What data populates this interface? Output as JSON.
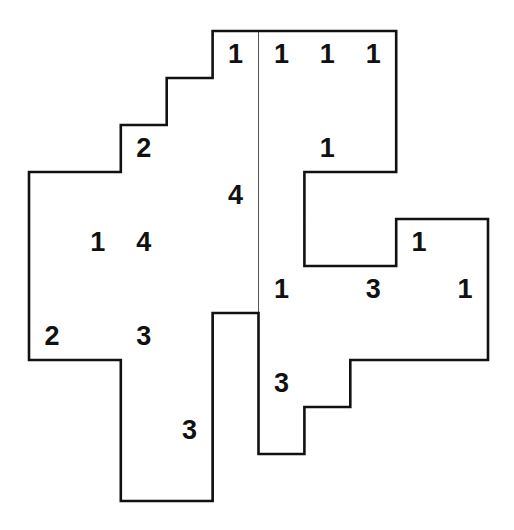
{
  "puzzle": {
    "origin": {
      "x": 29,
      "y": 31
    },
    "cell_size": {
      "w": 45.9,
      "h": 47
    },
    "rows": [
      {
        "r": 0,
        "cells": [
          [
            4,
            "1"
          ],
          [
            5,
            "1"
          ],
          [
            6,
            "1"
          ],
          [
            7,
            "1"
          ]
        ]
      },
      {
        "r": 1,
        "cells": [
          [
            3,
            ""
          ],
          [
            4,
            ""
          ],
          [
            5,
            ""
          ],
          [
            6,
            ""
          ],
          [
            7,
            ""
          ]
        ]
      },
      {
        "r": 2,
        "cells": [
          [
            2,
            "2"
          ],
          [
            3,
            ""
          ],
          [
            4,
            ""
          ],
          [
            5,
            ""
          ],
          [
            6,
            "1"
          ],
          [
            7,
            ""
          ]
        ]
      },
      {
        "r": 3,
        "cells": [
          [
            0,
            ""
          ],
          [
            1,
            ""
          ],
          [
            2,
            ""
          ],
          [
            3,
            ""
          ],
          [
            4,
            "4"
          ],
          [
            5,
            ""
          ]
        ]
      },
      {
        "r": 4,
        "cells": [
          [
            0,
            ""
          ],
          [
            1,
            "1"
          ],
          [
            2,
            "4"
          ],
          [
            3,
            ""
          ],
          [
            4,
            ""
          ],
          [
            5,
            ""
          ],
          [
            8,
            "1"
          ],
          [
            9,
            ""
          ]
        ]
      },
      {
        "r": 5,
        "cells": [
          [
            0,
            ""
          ],
          [
            1,
            ""
          ],
          [
            2,
            ""
          ],
          [
            3,
            ""
          ],
          [
            4,
            ""
          ],
          [
            5,
            "1"
          ],
          [
            6,
            ""
          ],
          [
            7,
            "3"
          ],
          [
            8,
            ""
          ],
          [
            9,
            "1"
          ]
        ]
      },
      {
        "r": 6,
        "cells": [
          [
            0,
            "2"
          ],
          [
            1,
            ""
          ],
          [
            2,
            "3"
          ],
          [
            3,
            ""
          ],
          [
            5,
            ""
          ],
          [
            6,
            ""
          ],
          [
            7,
            ""
          ],
          [
            8,
            ""
          ],
          [
            9,
            ""
          ]
        ]
      },
      {
        "r": 7,
        "cells": [
          [
            2,
            ""
          ],
          [
            3,
            ""
          ],
          [
            5,
            "3"
          ],
          [
            6,
            ""
          ]
        ]
      },
      {
        "r": 8,
        "cells": [
          [
            2,
            ""
          ],
          [
            3,
            "3"
          ],
          [
            5,
            ""
          ]
        ]
      },
      {
        "r": 9,
        "cells": [
          [
            2,
            ""
          ],
          [
            3,
            ""
          ]
        ]
      }
    ],
    "colors": {
      "outline": "#111111",
      "grid": "#555555",
      "digit": "#111111",
      "background": "#ffffff"
    }
  }
}
